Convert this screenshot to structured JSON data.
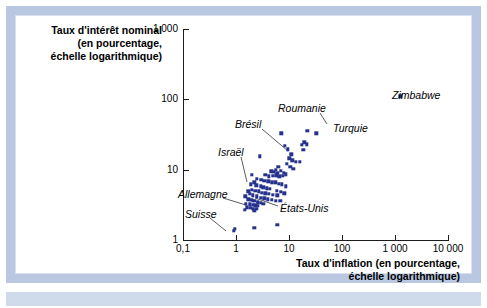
{
  "figure": {
    "frame_color": "#b9c8e0",
    "bottom_bar_color": "#cfdaea",
    "point_color": "#26318c"
  },
  "chart_data": {
    "type": "scatter",
    "title": "",
    "xlabel": "Taux d'inflation (en pourcentage, échelle logarithmique)",
    "ylabel": "Taux d'intérêt nominal (en pourcentage, échelle logarithmique)",
    "xlabel_lines": [
      "Taux d'inflation (en pourcentage,",
      "échelle logarithmique)"
    ],
    "ylabel_lines": [
      "Taux d'intérêt nominal",
      "(en pourcentage,",
      "échelle logarithmique)"
    ],
    "xscale": "log",
    "yscale": "log",
    "xlim": [
      0.1,
      10000
    ],
    "ylim": [
      1,
      1000
    ],
    "grid": false,
    "legend": "none",
    "xticks": [
      "0,1",
      "1",
      "10",
      "100",
      "1 000",
      "10 000"
    ],
    "xtick_values": [
      0.1,
      1,
      10,
      100,
      1000,
      10000
    ],
    "yticks": [
      "1",
      "10",
      "100",
      "1 000"
    ],
    "ytick_values": [
      1,
      10,
      100,
      1000
    ],
    "points": [
      {
        "x": 1250,
        "y": 110,
        "label": "Zimbabwe"
      },
      {
        "x": 22,
        "y": 36,
        "label": "Roumanie"
      },
      {
        "x": 33,
        "y": 33,
        "label": "Turquie"
      },
      {
        "x": 7.2,
        "y": 33,
        "label": "Brésil"
      },
      {
        "x": 2.8,
        "y": 15.5,
        "label": "Israël"
      },
      {
        "x": 2.1,
        "y": 3.6,
        "label": "Allemagne"
      },
      {
        "x": 0.9,
        "y": 1.35,
        "label": "Suisse"
      },
      {
        "x": 2.6,
        "y": 3.4,
        "label": "États-Unis"
      },
      {
        "x": 8.3,
        "y": 22.0,
        "label": ""
      },
      {
        "x": 9.5,
        "y": 19.5,
        "label": ""
      },
      {
        "x": 19.5,
        "y": 24.5,
        "label": ""
      },
      {
        "x": 21.5,
        "y": 23.0,
        "label": ""
      },
      {
        "x": 17.5,
        "y": 22.5,
        "label": ""
      },
      {
        "x": 18.5,
        "y": 19.0,
        "label": ""
      },
      {
        "x": 11.0,
        "y": 16.5,
        "label": ""
      },
      {
        "x": 10.2,
        "y": 14.5,
        "label": ""
      },
      {
        "x": 11.5,
        "y": 13.5,
        "label": ""
      },
      {
        "x": 13.5,
        "y": 13.0,
        "label": ""
      },
      {
        "x": 16.0,
        "y": 13.0,
        "label": ""
      },
      {
        "x": 9.0,
        "y": 12.0,
        "label": ""
      },
      {
        "x": 10.5,
        "y": 11.0,
        "label": ""
      },
      {
        "x": 12.0,
        "y": 10.2,
        "label": ""
      },
      {
        "x": 6.3,
        "y": 11.0,
        "label": ""
      },
      {
        "x": 5.6,
        "y": 10.0,
        "label": ""
      },
      {
        "x": 7.0,
        "y": 9.6,
        "label": ""
      },
      {
        "x": 6.0,
        "y": 9.0,
        "label": ""
      },
      {
        "x": 5.2,
        "y": 9.3,
        "label": ""
      },
      {
        "x": 4.6,
        "y": 9.5,
        "label": ""
      },
      {
        "x": 8.0,
        "y": 9.0,
        "label": ""
      },
      {
        "x": 8.8,
        "y": 8.6,
        "label": ""
      },
      {
        "x": 7.6,
        "y": 8.2,
        "label": ""
      },
      {
        "x": 6.6,
        "y": 8.0,
        "label": ""
      },
      {
        "x": 5.8,
        "y": 8.3,
        "label": ""
      },
      {
        "x": 4.9,
        "y": 8.2,
        "label": ""
      },
      {
        "x": 4.2,
        "y": 8.0,
        "label": ""
      },
      {
        "x": 3.6,
        "y": 8.5,
        "label": ""
      },
      {
        "x": 2.0,
        "y": 8.5,
        "label": ""
      },
      {
        "x": 2.5,
        "y": 7.4,
        "label": ""
      },
      {
        "x": 3.0,
        "y": 7.2,
        "label": ""
      },
      {
        "x": 3.4,
        "y": 6.9,
        "label": ""
      },
      {
        "x": 4.1,
        "y": 6.8,
        "label": ""
      },
      {
        "x": 4.8,
        "y": 6.6,
        "label": ""
      },
      {
        "x": 5.5,
        "y": 6.6,
        "label": ""
      },
      {
        "x": 6.4,
        "y": 6.3,
        "label": ""
      },
      {
        "x": 7.4,
        "y": 6.2,
        "label": ""
      },
      {
        "x": 8.6,
        "y": 5.8,
        "label": ""
      },
      {
        "x": 2.2,
        "y": 6.6,
        "label": ""
      },
      {
        "x": 1.9,
        "y": 6.2,
        "label": ""
      },
      {
        "x": 2.4,
        "y": 6.0,
        "label": ""
      },
      {
        "x": 2.9,
        "y": 5.8,
        "label": ""
      },
      {
        "x": 3.3,
        "y": 5.6,
        "label": ""
      },
      {
        "x": 3.8,
        "y": 5.4,
        "label": ""
      },
      {
        "x": 4.4,
        "y": 5.3,
        "label": ""
      },
      {
        "x": 2.0,
        "y": 5.2,
        "label": ""
      },
      {
        "x": 2.3,
        "y": 5.0,
        "label": ""
      },
      {
        "x": 2.7,
        "y": 4.9,
        "label": ""
      },
      {
        "x": 3.1,
        "y": 4.7,
        "label": ""
      },
      {
        "x": 3.6,
        "y": 4.6,
        "label": ""
      },
      {
        "x": 4.2,
        "y": 4.5,
        "label": ""
      },
      {
        "x": 5.0,
        "y": 4.4,
        "label": ""
      },
      {
        "x": 6.0,
        "y": 4.3,
        "label": ""
      },
      {
        "x": 1.8,
        "y": 4.5,
        "label": ""
      },
      {
        "x": 2.1,
        "y": 4.3,
        "label": ""
      },
      {
        "x": 2.5,
        "y": 4.2,
        "label": ""
      },
      {
        "x": 2.9,
        "y": 4.0,
        "label": ""
      },
      {
        "x": 3.4,
        "y": 3.9,
        "label": ""
      },
      {
        "x": 4.0,
        "y": 3.8,
        "label": ""
      },
      {
        "x": 4.7,
        "y": 3.7,
        "label": ""
      },
      {
        "x": 5.6,
        "y": 3.6,
        "label": ""
      },
      {
        "x": 6.8,
        "y": 3.6,
        "label": ""
      },
      {
        "x": 1.7,
        "y": 3.8,
        "label": ""
      },
      {
        "x": 1.95,
        "y": 3.7,
        "label": ""
      },
      {
        "x": 2.25,
        "y": 3.6,
        "label": ""
      },
      {
        "x": 2.55,
        "y": 3.5,
        "label": ""
      },
      {
        "x": 2.9,
        "y": 3.4,
        "label": ""
      },
      {
        "x": 3.3,
        "y": 3.3,
        "label": ""
      },
      {
        "x": 1.55,
        "y": 3.3,
        "label": ""
      },
      {
        "x": 1.8,
        "y": 3.2,
        "label": ""
      },
      {
        "x": 2.05,
        "y": 3.15,
        "label": ""
      },
      {
        "x": 2.3,
        "y": 3.1,
        "label": ""
      },
      {
        "x": 2.6,
        "y": 3.05,
        "label": ""
      },
      {
        "x": 1.6,
        "y": 2.9,
        "label": ""
      },
      {
        "x": 1.85,
        "y": 2.85,
        "label": ""
      },
      {
        "x": 2.1,
        "y": 2.8,
        "label": ""
      },
      {
        "x": 2.4,
        "y": 2.8,
        "label": ""
      },
      {
        "x": 1.45,
        "y": 2.7,
        "label": ""
      },
      {
        "x": 2.2,
        "y": 2.6,
        "label": ""
      },
      {
        "x": 1.7,
        "y": 4.9,
        "label": ""
      },
      {
        "x": 1.5,
        "y": 4.2,
        "label": ""
      },
      {
        "x": 5.9,
        "y": 5.0,
        "label": ""
      },
      {
        "x": 7.0,
        "y": 4.8,
        "label": ""
      },
      {
        "x": 8.2,
        "y": 4.6,
        "label": ""
      },
      {
        "x": 2.2,
        "y": 1.5,
        "label": ""
      },
      {
        "x": 6.0,
        "y": 1.65,
        "label": ""
      },
      {
        "x": 0.95,
        "y": 1.45,
        "label": ""
      }
    ],
    "annotations": [
      {
        "text": "Zimbabwe",
        "side": "right",
        "px": 392,
        "py": 95,
        "leader": false
      },
      {
        "text": "Roumanie",
        "side": "right",
        "px": 278,
        "py": 108,
        "leader": true,
        "lx1": 320,
        "ly1": 113,
        "lx2": 327,
        "ly2": 124
      },
      {
        "text": "Turquie",
        "side": "right",
        "px": 333,
        "py": 128,
        "leader": false
      },
      {
        "text": "Brésil",
        "side": "right",
        "px": 235,
        "py": 124,
        "leader": true,
        "lx1": 262,
        "ly1": 129,
        "lx2": 288,
        "ly2": 151
      },
      {
        "text": "Israël",
        "side": "right",
        "px": 218,
        "py": 152,
        "leader": true,
        "lx1": 241,
        "ly1": 157,
        "lx2": 247,
        "ly2": 182
      },
      {
        "text": "Allemagne",
        "side": "right",
        "px": 178,
        "py": 194,
        "leader": true,
        "lx1": 223,
        "ly1": 198,
        "lx2": 246,
        "ly2": 205
      },
      {
        "text": "Suisse",
        "side": "right",
        "px": 185,
        "py": 214,
        "leader": true,
        "lx1": 210,
        "ly1": 218,
        "lx2": 226,
        "ly2": 231
      },
      {
        "text": "États-Unis",
        "side": "right",
        "px": 280,
        "py": 208,
        "leader": true,
        "lx1": 278,
        "ly1": 206,
        "lx2": 255,
        "ly2": 198
      }
    ]
  }
}
